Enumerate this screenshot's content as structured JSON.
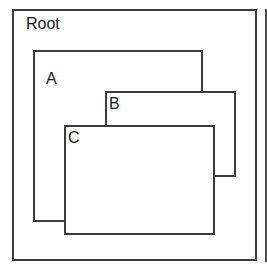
{
  "diagram": {
    "type": "nested-windows",
    "root": {
      "label": "Root"
    },
    "windows": [
      {
        "id": "A",
        "label": "A"
      },
      {
        "id": "B",
        "label": "B"
      },
      {
        "id": "C",
        "label": "C"
      }
    ],
    "colors": {
      "stroke": "#3c3c3c",
      "fill": "#ffffff",
      "text": "#1a1a1a"
    }
  }
}
